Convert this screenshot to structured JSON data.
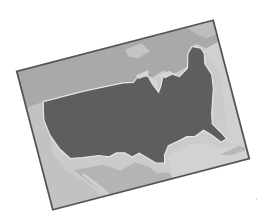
{
  "image": {
    "description": "Grayscale photo of a tilted map card showing the contiguous United States",
    "subject": "United States map",
    "colors": {
      "background": "#ffffff",
      "card_border": "#555555",
      "usa_land": "#5e5e5e",
      "usa_outline": "#e6e6e6",
      "canada_land": "#a9a9a9",
      "mexico_land": "#b4b4b4",
      "ocean": "#cbcbcb",
      "lakes": "#d6d6d6"
    },
    "card": {
      "rotation_deg": -14.6,
      "corners": {
        "top_left": [
          16,
          72
        ],
        "top_right": [
          212,
          21
        ],
        "bottom_right": [
          250,
          156
        ],
        "bottom_left": [
          55,
          210
        ]
      }
    }
  }
}
